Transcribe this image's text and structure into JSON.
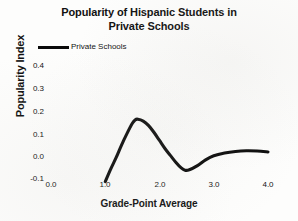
{
  "chart_data": {
    "type": "line",
    "title": "Popularity of Hispanic Students in Private Schools",
    "title_line1": "Popularity of Hispanic Students in",
    "title_line2": "Private Schools",
    "xlabel": "Grade-Point Average",
    "ylabel": "Popularity Index",
    "xlim": [
      0.0,
      4.0
    ],
    "ylim": [
      -0.1,
      0.4
    ],
    "xticks": [
      "0.0",
      "1.0",
      "2.0",
      "3.0",
      "4.0"
    ],
    "xtick_values": [
      0.0,
      1.0,
      2.0,
      3.0,
      4.0
    ],
    "yticks": [
      "0.4",
      "0.3",
      "0.2",
      "0.1",
      "0.0",
      "-0.1"
    ],
    "ytick_values": [
      0.4,
      0.3,
      0.2,
      0.1,
      0.0,
      -0.1
    ],
    "grid": false,
    "legend_position": "top-left",
    "series": [
      {
        "name": "Private Schools",
        "color": "#0a0a0a",
        "x": [
          1.0,
          1.1,
          1.2,
          1.3,
          1.4,
          1.5,
          1.55,
          1.6,
          1.7,
          1.8,
          1.9,
          2.0,
          2.1,
          2.2,
          2.3,
          2.4,
          2.47,
          2.55,
          2.7,
          2.85,
          3.0,
          3.2,
          3.4,
          3.6,
          3.8,
          4.0
        ],
        "y": [
          -0.11,
          -0.055,
          -0.005,
          0.05,
          0.1,
          0.145,
          0.16,
          0.163,
          0.155,
          0.135,
          0.105,
          0.07,
          0.035,
          0.005,
          -0.025,
          -0.05,
          -0.06,
          -0.058,
          -0.04,
          -0.015,
          0.003,
          0.015,
          0.022,
          0.025,
          0.024,
          0.02
        ]
      }
    ]
  },
  "legend": {
    "entries": [
      {
        "label": "Private Schools",
        "color": "#0a0a0a"
      }
    ]
  },
  "axes": {
    "x_title": "Grade-Point Average",
    "y_title": "Popularity Index"
  }
}
